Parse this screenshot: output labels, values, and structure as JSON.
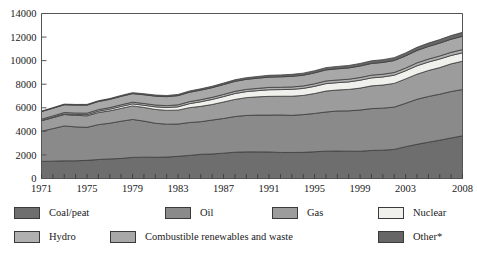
{
  "title": "",
  "chart_data": {
    "type": "area",
    "stacked": true,
    "title": "",
    "xlabel": "",
    "ylabel": "",
    "ylim": [
      0,
      14000
    ],
    "ytick_step": 2000,
    "yticks": [
      "0",
      "2000",
      "4000",
      "6000",
      "8000",
      "10000",
      "12000",
      "14000"
    ],
    "grid": false,
    "legend_position": "bottom",
    "x_tick_interval_years": 1,
    "xtick_labels": [
      "1971",
      "1975",
      "1979",
      "1983",
      "1987",
      "1991",
      "1995",
      "1999",
      "2003",
      "2008"
    ],
    "x": [
      1971,
      1972,
      1973,
      1974,
      1975,
      1976,
      1977,
      1978,
      1979,
      1980,
      1981,
      1982,
      1983,
      1984,
      1985,
      1986,
      1987,
      1988,
      1989,
      1990,
      1991,
      1992,
      1993,
      1994,
      1995,
      1996,
      1997,
      1998,
      1999,
      2000,
      2001,
      2002,
      2003,
      2004,
      2005,
      2006,
      2007,
      2008
    ],
    "series": [
      {
        "name": "Coal/peat",
        "color": "#6e6e6e",
        "values": [
          1450,
          1470,
          1500,
          1500,
          1540,
          1610,
          1660,
          1700,
          1790,
          1810,
          1800,
          1820,
          1880,
          1960,
          2050,
          2080,
          2150,
          2230,
          2260,
          2260,
          2250,
          2210,
          2210,
          2220,
          2270,
          2320,
          2330,
          2320,
          2310,
          2380,
          2400,
          2470,
          2700,
          2900,
          3080,
          3250,
          3440,
          3620
        ]
      },
      {
        "name": "Oil",
        "color": "#8a8a8a",
        "values": [
          2560,
          2760,
          2960,
          2880,
          2800,
          2960,
          3030,
          3160,
          3220,
          3060,
          2890,
          2790,
          2740,
          2790,
          2770,
          2880,
          2940,
          3030,
          3090,
          3120,
          3130,
          3180,
          3150,
          3200,
          3250,
          3320,
          3400,
          3420,
          3500,
          3550,
          3570,
          3590,
          3680,
          3820,
          3880,
          3900,
          3940,
          3930
        ]
      },
      {
        "name": "Gas",
        "color": "#9c9c9c",
        "values": [
          890,
          930,
          970,
          980,
          980,
          1030,
          1050,
          1090,
          1150,
          1160,
          1170,
          1170,
          1180,
          1260,
          1300,
          1320,
          1400,
          1450,
          1510,
          1550,
          1590,
          1590,
          1620,
          1630,
          1690,
          1780,
          1780,
          1820,
          1860,
          1930,
          1960,
          2010,
          2070,
          2130,
          2200,
          2260,
          2350,
          2400
        ]
      },
      {
        "name": "Nuclear",
        "color": "#f0f0ec",
        "values": [
          29,
          40,
          53,
          72,
          97,
          113,
          142,
          165,
          170,
          186,
          222,
          241,
          282,
          337,
          393,
          427,
          461,
          499,
          511,
          526,
          561,
          565,
          583,
          594,
          609,
          631,
          623,
          636,
          668,
          676,
          687,
          692,
          687,
          714,
          721,
          728,
          709,
          712
        ]
      },
      {
        "name": "Hydro",
        "color": "#b0b0b0",
        "values": [
          104,
          110,
          113,
          123,
          126,
          128,
          132,
          142,
          146,
          150,
          154,
          158,
          168,
          173,
          175,
          180,
          183,
          188,
          187,
          191,
          197,
          197,
          206,
          207,
          217,
          223,
          224,
          227,
          230,
          233,
          230,
          232,
          234,
          245,
          250,
          258,
          265,
          276
        ]
      },
      {
        "name": "Combustible renewables and waste",
        "color": "#a8a8a8",
        "values": [
          640,
          650,
          660,
          670,
          680,
          690,
          700,
          715,
          725,
          740,
          755,
          765,
          780,
          795,
          810,
          820,
          835,
          845,
          855,
          865,
          875,
          885,
          900,
          910,
          925,
          940,
          950,
          960,
          975,
          990,
          1000,
          1015,
          1030,
          1050,
          1070,
          1090,
          1110,
          1130
        ]
      },
      {
        "name": "Other*",
        "color": "#666666",
        "values": [
          48,
          52,
          56,
          60,
          64,
          68,
          72,
          76,
          82,
          88,
          92,
          96,
          102,
          108,
          114,
          120,
          126,
          133,
          140,
          147,
          154,
          160,
          168,
          176,
          184,
          192,
          200,
          208,
          216,
          226,
          236,
          246,
          258,
          272,
          286,
          300,
          316,
          334
        ]
      }
    ],
    "totals_note": "Mtoe"
  },
  "legend": {
    "items": [
      {
        "label": "Coal/peat",
        "color": "#6e6e6e"
      },
      {
        "label": "Oil",
        "color": "#8a8a8a"
      },
      {
        "label": "Gas",
        "color": "#9c9c9c"
      },
      {
        "label": "Nuclear",
        "color": "#f0f0ec"
      },
      {
        "label": "Hydro",
        "color": "#b0b0b0"
      },
      {
        "label": "Combustible renewables and waste",
        "color": "#a8a8a8"
      },
      {
        "label": "Other*",
        "color": "#666666"
      }
    ]
  }
}
